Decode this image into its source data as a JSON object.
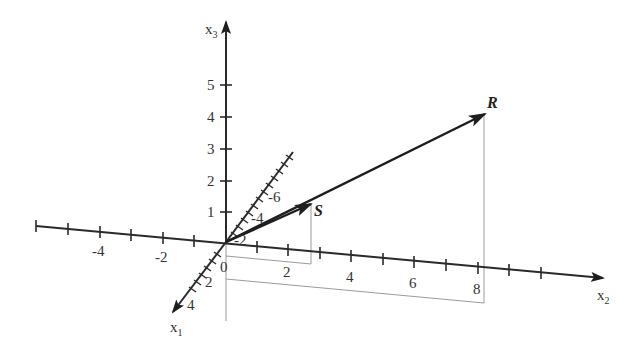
{
  "figure": {
    "type": "3d-vector-diagram",
    "axes": {
      "x1": {
        "label": "x",
        "subscript": "1",
        "tick_labels": [
          "-6",
          "-4",
          "-2",
          "2",
          "4"
        ]
      },
      "x2": {
        "label": "x",
        "subscript": "2",
        "tick_labels": [
          "-4",
          "-2",
          "0",
          "2",
          "4",
          "6",
          "8"
        ]
      },
      "x3": {
        "label": "x",
        "subscript": "3",
        "tick_labels": [
          "1",
          "2",
          "3",
          "4",
          "5"
        ]
      }
    },
    "vectors": [
      {
        "name": "S",
        "label": "S"
      },
      {
        "name": "R",
        "label": "R"
      }
    ],
    "colors": {
      "axis": "#2a2a2a",
      "vector": "#1e1e1e",
      "projection": "#9a9a9a",
      "text": "#333333"
    }
  }
}
